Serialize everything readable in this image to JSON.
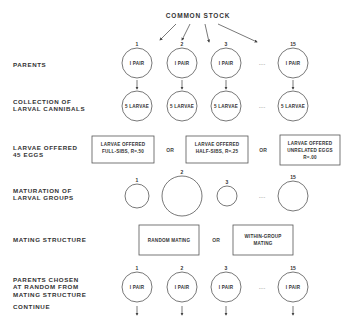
{
  "title": "COMMON STOCK",
  "row_labels": {
    "parents": "PARENTS",
    "collection": "COLLECTION OF\nLARVAL CANNIBALS",
    "offered": "LARVAE OFFERED\n45 EGGS",
    "maturation": "MATURATION OF\nLARVAL GROUPS",
    "mating": "MATING STRUCTURE",
    "chosen": "PARENTS CHOSEN\nAT RANDOM FROM\nMATING STRUCTURE",
    "continue": "CONTINUE"
  },
  "group_numbers": [
    "1",
    "2",
    "3",
    "15"
  ],
  "ellipsis": "....",
  "parent_node": "I PAIR",
  "larvae_node": "5 LARVAE",
  "treatments": [
    {
      "line1": "LARVAE OFFERED",
      "line2": "FULL-SIBS, R=.50",
      "line3": ""
    },
    {
      "line1": "LARVAE OFFERED",
      "line2": "HALF-SIBS, R=.25",
      "line3": ""
    },
    {
      "line1": "LARVAE OFFERED",
      "line2": "UNRELATED EGGS",
      "line3": "R=.00"
    }
  ],
  "or_label": "OR",
  "mating_options": [
    {
      "line1": "RANDOM MATING",
      "line2": ""
    },
    {
      "line1": "WITHIN-GROUP",
      "line2": "MATING"
    }
  ],
  "maturation_relative_sizes": [
    1.2,
    2.0,
    1.0,
    1.5
  ]
}
